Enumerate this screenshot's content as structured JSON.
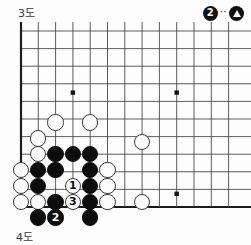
{
  "diagram": {
    "top_caption": "3도",
    "bottom_caption": "4도",
    "legend": {
      "stone_label": "2",
      "connector": "··",
      "marked_stone_icon": "triangle-marked-black-stone"
    },
    "board": {
      "cols": 13,
      "rows": 11,
      "origin_x": 21,
      "origin_y": 9,
      "step_x": 17.3,
      "step_y": 17.6,
      "line_color": "#4a4a4a",
      "edge_color": "#1c1c1c",
      "background": "#fdfdfd",
      "stone_radius": 8.2,
      "star_points": [
        {
          "col": 3,
          "row": 3.5
        },
        {
          "col": 9,
          "row": 3.5
        },
        {
          "col": 9,
          "row": 9.25
        }
      ],
      "stones": [
        {
          "color": "white",
          "col": 2,
          "row": 5.2,
          "label": ""
        },
        {
          "color": "white",
          "col": 4,
          "row": 5.2,
          "label": ""
        },
        {
          "color": "white",
          "col": 1,
          "row": 6.1,
          "label": ""
        },
        {
          "color": "white",
          "col": 7,
          "row": 6.3,
          "label": ""
        },
        {
          "color": "white",
          "col": 1,
          "row": 7.0,
          "label": ""
        },
        {
          "color": "black",
          "col": 2,
          "row": 7.0,
          "label": ""
        },
        {
          "color": "black",
          "col": 3,
          "row": 7.0,
          "label": ""
        },
        {
          "color": "black",
          "col": 4,
          "row": 7.0,
          "label": ""
        },
        {
          "color": "white",
          "col": 0,
          "row": 7.9,
          "label": ""
        },
        {
          "color": "black",
          "col": 1,
          "row": 7.9,
          "label": ""
        },
        {
          "color": "black",
          "col": 2,
          "row": 7.9,
          "label": ""
        },
        {
          "color": "black",
          "col": 4,
          "row": 7.9,
          "label": ""
        },
        {
          "color": "white",
          "col": 5,
          "row": 7.9,
          "label": ""
        },
        {
          "color": "white",
          "col": 0,
          "row": 8.8,
          "label": ""
        },
        {
          "color": "black",
          "col": 1,
          "row": 8.8,
          "label": ""
        },
        {
          "color": "white",
          "col": 3,
          "row": 8.8,
          "label": "1"
        },
        {
          "color": "black",
          "col": 4,
          "row": 8.8,
          "label": ""
        },
        {
          "color": "white",
          "col": 5,
          "row": 8.8,
          "label": ""
        },
        {
          "color": "white",
          "col": 0,
          "row": 9.7,
          "label": ""
        },
        {
          "color": "white",
          "col": 1,
          "row": 9.7,
          "label": ""
        },
        {
          "color": "black",
          "col": 2,
          "row": 9.7,
          "label": ""
        },
        {
          "color": "white",
          "col": 3,
          "row": 9.7,
          "label": "3"
        },
        {
          "color": "black",
          "col": 4,
          "row": 9.7,
          "label": ""
        },
        {
          "color": "white",
          "col": 5,
          "row": 9.7,
          "label": ""
        },
        {
          "color": "white",
          "col": 7,
          "row": 9.7,
          "label": ""
        },
        {
          "color": "black",
          "col": 1,
          "row": 10.6,
          "label": ""
        },
        {
          "color": "black",
          "col": 2,
          "row": 10.6,
          "label": "2"
        },
        {
          "color": "black",
          "col": 4,
          "row": 10.6,
          "label": ""
        }
      ]
    }
  }
}
